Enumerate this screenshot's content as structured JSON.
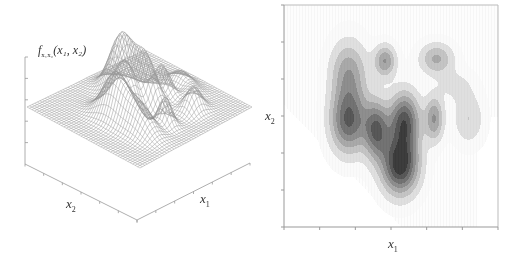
{
  "chart_data": [
    {
      "type": "surface",
      "title": "",
      "zlabel": "f_{x1,x2}(x1, x2)",
      "xlabel": "x1",
      "ylabel": "x2",
      "z_ticks_count": 5,
      "x_ticks_count": 7,
      "y_ticks_count": 7,
      "grid": false,
      "style": "wireframe mesh, gray lines",
      "features": "multi-modal density with several ridges; tallest peak near center-top, deep trough near front corner"
    },
    {
      "type": "heatmap",
      "subtype": "filled contour",
      "xlabel": "x1",
      "ylabel": "x2",
      "x_ticks_count": 7,
      "y_ticks_count": 7,
      "colormap": "grayscale (white = low, dark = high)",
      "levels": 8,
      "blobs": [
        {
          "cx": 0.3,
          "cy": 0.3,
          "sx": 0.06,
          "sy": 0.1,
          "amp": 0.45
        },
        {
          "cx": 0.3,
          "cy": 0.52,
          "sx": 0.06,
          "sy": 0.1,
          "amp": 0.75
        },
        {
          "cx": 0.47,
          "cy": 0.25,
          "sx": 0.035,
          "sy": 0.05,
          "amp": 0.5
        },
        {
          "cx": 0.43,
          "cy": 0.56,
          "sx": 0.04,
          "sy": 0.09,
          "amp": 0.7
        },
        {
          "cx": 0.56,
          "cy": 0.52,
          "sx": 0.05,
          "sy": 0.09,
          "amp": 0.8
        },
        {
          "cx": 0.54,
          "cy": 0.72,
          "sx": 0.06,
          "sy": 0.09,
          "amp": 0.95
        },
        {
          "cx": 0.71,
          "cy": 0.24,
          "sx": 0.055,
          "sy": 0.05,
          "amp": 0.4
        },
        {
          "cx": 0.7,
          "cy": 0.51,
          "sx": 0.03,
          "sy": 0.07,
          "amp": 0.5
        },
        {
          "cx": 0.86,
          "cy": 0.51,
          "sx": 0.05,
          "sy": 0.08,
          "amp": 0.25
        },
        {
          "cx": 0.8,
          "cy": 0.36,
          "sx": 0.06,
          "sy": 0.05,
          "amp": 0.15
        }
      ]
    }
  ],
  "surface_plot": {
    "z_label_main": "f",
    "z_label_sub": "x₁x₂",
    "z_label_args": "(x₁, x₂)",
    "x1_label": "x",
    "x1_sub": "1",
    "x2_label": "x",
    "x2_sub": "2"
  },
  "contour_plot": {
    "x_label": "x",
    "x_sub": "1",
    "y_label": "x",
    "y_sub": "2"
  }
}
